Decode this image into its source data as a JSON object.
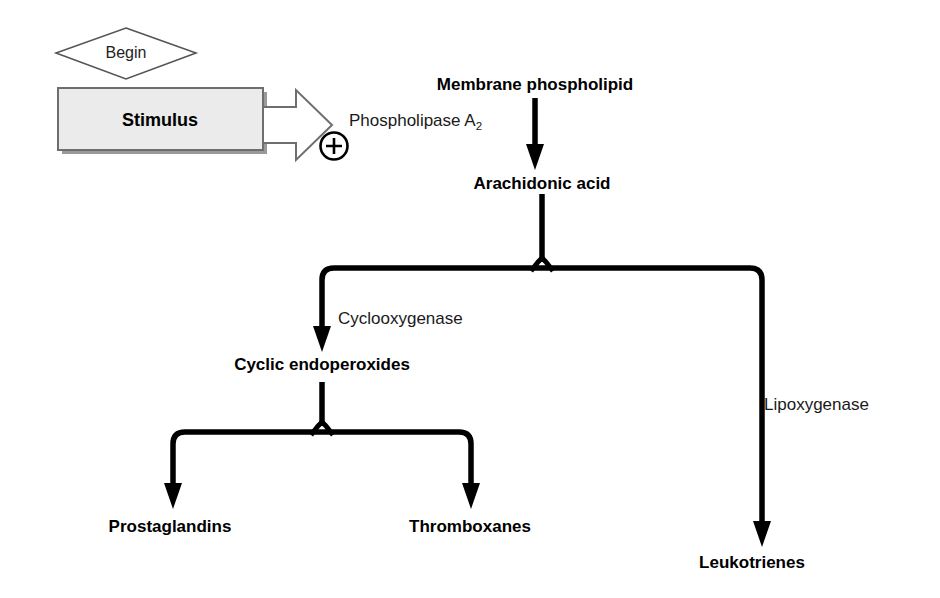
{
  "diagram": {
    "background_color": "#ffffff",
    "line_color": "#000000",
    "box_fill_color": "#ebebeb",
    "box_border_color": "#6e6e6e",
    "nodes": {
      "begin": "Begin",
      "stimulus": "Stimulus",
      "membrane_phospholipid": "Membrane phospholipid",
      "arachidonic_acid": "Arachidonic acid",
      "cyclic_endoperoxides": "Cyclic endoperoxides",
      "prostaglandins": "Prostaglandins",
      "thromboxanes": "Thromboxanes",
      "leukotrienes": "Leukotrienes"
    },
    "enzymes": {
      "phospholipase_name": "Phospholipase A",
      "phospholipase_subscript": "2",
      "cyclooxygenase": "Cyclooxygenase",
      "lipoxygenase": "Lipoxygenase"
    },
    "symbols": {
      "activation": "+"
    }
  }
}
